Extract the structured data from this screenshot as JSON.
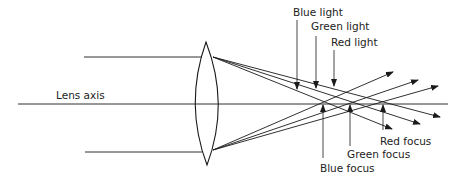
{
  "diagram": {
    "axis_label": "Lens axis",
    "light_labels": [
      "Blue light",
      "Green light",
      "Red light"
    ],
    "focus_labels": [
      "Blue focus",
      "Green focus",
      "Red focus"
    ],
    "colors": {
      "line": "#1a1a1a",
      "text": "#222222",
      "background": "#ffffff"
    }
  }
}
